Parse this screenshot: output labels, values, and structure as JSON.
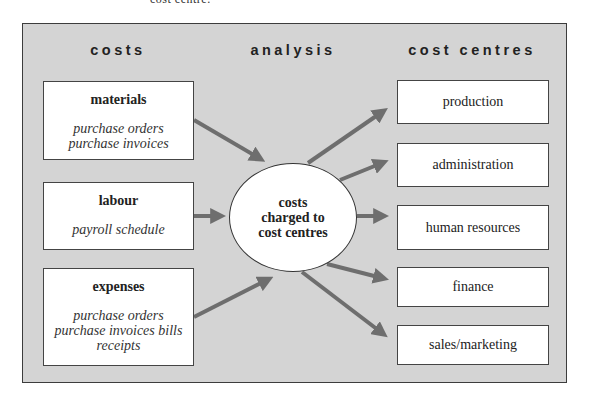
{
  "caption_fragment": "cost centre.",
  "headings": {
    "costs": "costs",
    "analysis": "analysis",
    "cost_centres": "cost centres"
  },
  "cost_sources": [
    {
      "title": "materials",
      "lines": [
        "purchase orders",
        "purchase invoices"
      ]
    },
    {
      "title": "labour",
      "lines": [
        "payroll schedule"
      ]
    },
    {
      "title": "expenses",
      "lines": [
        "purchase orders",
        "purchase invoices bills",
        "receipts"
      ]
    }
  ],
  "hub": {
    "lines": [
      "costs",
      "charged to",
      "cost centres"
    ]
  },
  "cost_centres": [
    {
      "label": "production"
    },
    {
      "label": "administration"
    },
    {
      "label": "human resources"
    },
    {
      "label": "finance"
    },
    {
      "label": "sales/marketing"
    }
  ],
  "colors": {
    "background_panel": "#d4d4d4",
    "arrow": "#6e6e6e",
    "border": "#3c3c3c"
  }
}
